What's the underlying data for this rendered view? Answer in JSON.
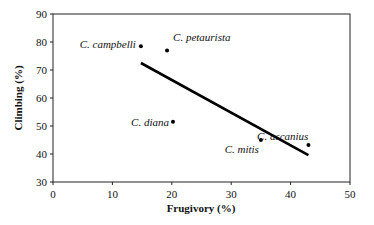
{
  "chart_data": {
    "type": "scatter",
    "title": "",
    "xlabel": "Frugivory (%)",
    "ylabel": "Climbing (%)",
    "xlim": [
      0,
      50
    ],
    "ylim": [
      30,
      90
    ],
    "xticks": [
      0,
      10,
      20,
      30,
      40,
      50
    ],
    "yticks": [
      30,
      40,
      50,
      60,
      70,
      80,
      90
    ],
    "grid": false,
    "legend": null,
    "points": [
      {
        "label": "C. campbelli",
        "x": 14.8,
        "y": 78.5
      },
      {
        "label": "C. petaurista",
        "x": 19.2,
        "y": 77.0
      },
      {
        "label": "C. diana",
        "x": 20.2,
        "y": 51.5
      },
      {
        "label": "C. mitis",
        "x": 35.0,
        "y": 45.0
      },
      {
        "label": "C. ascanius",
        "x": 43.0,
        "y": 43.2
      }
    ],
    "trendline": {
      "x": [
        14.8,
        43.0
      ],
      "y": [
        72.5,
        39.6
      ]
    }
  }
}
